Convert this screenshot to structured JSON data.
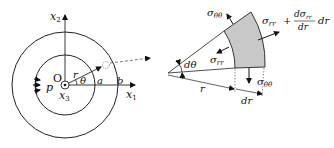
{
  "left_diagram": {
    "axis_x2": "x",
    "axis_x2_sub": "2",
    "axis_x1": "x",
    "axis_x1_sub": "1",
    "axis_x3": "x",
    "axis_x3_sub": "3",
    "origin_label": "O",
    "pressure_label": "p",
    "radius_label": "r",
    "angle_label": "θ",
    "inner_radius_label": "a",
    "outer_radius_label": "b"
  },
  "right_diagram": {
    "sigma_theta_top": "σ",
    "sigma_theta_top_sub": "θθ",
    "sigma_theta_bottom": "σ",
    "sigma_theta_bottom_sub": "θθ",
    "sigma_rr_inner": "σ",
    "sigma_rr_inner_sub": "rr",
    "sigma_rr_outer_prefix": "σ",
    "sigma_rr_outer_sub": "rr",
    "sigma_rr_outer_plus": "+",
    "sigma_rr_outer_num": "dσ",
    "sigma_rr_outer_num_sub": "rr",
    "sigma_rr_outer_den": "dr",
    "sigma_rr_outer_suffix": "dr",
    "dtheta_label": "dθ",
    "r_label": "r",
    "dr_label": "dr",
    "element_fill": "#c8c8c8"
  }
}
